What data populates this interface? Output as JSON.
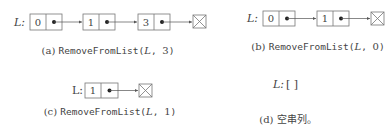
{
  "panels": [
    {
      "id": "a",
      "list_label": "L:",
      "nodes": [
        "0",
        "1",
        "3"
      ],
      "caption": {
        "prefix": "(a)",
        "func": "RemoveFromList(",
        "arg1": "L",
        "sep": ", ",
        "arg2": "3",
        "suffix": ")"
      }
    },
    {
      "id": "b",
      "list_label": "L:",
      "nodes": [
        "0",
        "1"
      ],
      "caption": {
        "prefix": "(b)",
        "func": "RemoveFromList(",
        "arg1": "L",
        "sep": ", ",
        "arg2": "0",
        "suffix": ")"
      }
    },
    {
      "id": "c",
      "list_label": "L:",
      "nodes": [
        "1"
      ],
      "caption": {
        "prefix": "(c)",
        "func": "RemoveFromList(",
        "arg1": "L",
        "sep": ", ",
        "arg2": "1",
        "suffix": ")"
      }
    },
    {
      "id": "d",
      "list_label": "L:",
      "empty_text": "[ ]",
      "caption": {
        "prefix": "(d)",
        "text": "空串列。"
      }
    }
  ],
  "colors": {
    "stroke": "#666666",
    "text": "#444444",
    "background": "#ffffff"
  }
}
